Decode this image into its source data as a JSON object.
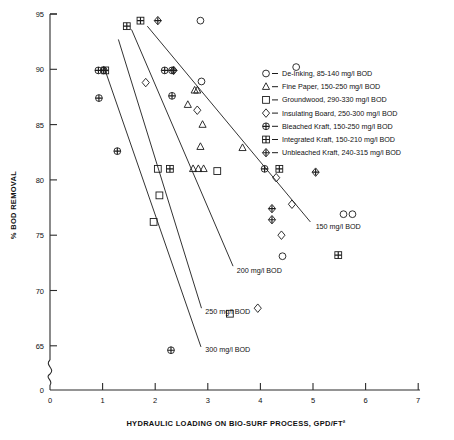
{
  "chart_data": {
    "type": "scatter",
    "title": "",
    "xlabel": "HYDRAULIC LOADING ON BIO-SURF PROCESS, GPD/FT²",
    "ylabel": "% BOD REMOVAL",
    "xlim": [
      0,
      7
    ],
    "ylim_break": true,
    "ylim": [
      63,
      95
    ],
    "y_break_value": "0",
    "grid": false,
    "legend_position": "upper-right",
    "xticks": [
      "0",
      "1",
      "2",
      "3",
      "4",
      "5",
      "6",
      "7"
    ],
    "yticks": [
      "0",
      "65",
      "70",
      "75",
      "80",
      "85",
      "90",
      "95"
    ],
    "legend": [
      {
        "symbol": "circle-open",
        "label": "De-Inking, 85-140 mg/l BOD"
      },
      {
        "symbol": "triangle-open",
        "label": "Fine Paper, 150-250 mg/l BOD"
      },
      {
        "symbol": "square-open",
        "label": "Groundwood, 290-330 mg/l BOD"
      },
      {
        "symbol": "diamond-open",
        "label": "Insulating Board, 250-300 mg/l BOD"
      },
      {
        "symbol": "circle-cross",
        "label": "Bleached Kraft, 150-250 mg/l BOD"
      },
      {
        "symbol": "square-cross",
        "label": "Integrated Kraft, 150-210 mg/l BOD"
      },
      {
        "symbol": "diamond-cross",
        "label": "Unbleached Kraft, 240-315 mg/l BOD"
      }
    ],
    "annotations": [
      {
        "text": "150 mg/l BOD",
        "x": 5.05,
        "y": 75.6
      },
      {
        "text": "200 mg/l BOD",
        "x": 3.55,
        "y": 71.6
      },
      {
        "text": "250 mg/l BOD",
        "x": 2.95,
        "y": 67.9
      },
      {
        "text": "300 mg/l BOD",
        "x": 2.95,
        "y": 64.4
      }
    ],
    "trend_lines": [
      {
        "name": "150 mg/l BOD",
        "x1": 1.85,
        "y1": 93.9,
        "x2": 4.95,
        "y2": 76.2
      },
      {
        "name": "200 mg/l BOD",
        "x1": 1.55,
        "y1": 93.6,
        "x2": 3.48,
        "y2": 72.2
      },
      {
        "name": "250 mg/l BOD",
        "x1": 1.3,
        "y1": 92.7,
        "x2": 2.88,
        "y2": 68.4
      },
      {
        "name": "300 mg/l BOD",
        "x1": 1.02,
        "y1": 90.3,
        "x2": 2.87,
        "y2": 64.9
      }
    ],
    "series": [
      {
        "name": "De-Inking, 85-140 mg/l BOD",
        "symbol": "circle-open",
        "points": [
          [
            2.86,
            94.4
          ],
          [
            4.68,
            90.2
          ],
          [
            2.88,
            88.9
          ],
          [
            5.58,
            76.9
          ],
          [
            5.75,
            76.9
          ],
          [
            4.42,
            73.1
          ]
        ]
      },
      {
        "name": "Fine Paper, 150-250 mg/l BOD",
        "symbol": "triangle-open",
        "points": [
          [
            2.75,
            88.1
          ],
          [
            2.8,
            88.1
          ],
          [
            2.62,
            86.8
          ],
          [
            2.9,
            85.0
          ],
          [
            2.86,
            83.0
          ],
          [
            2.72,
            81.0
          ],
          [
            2.82,
            81.0
          ],
          [
            2.92,
            81.0
          ],
          [
            3.66,
            82.9
          ]
        ]
      },
      {
        "name": "Groundwood, 290-330 mg/l BOD",
        "symbol": "square-open",
        "points": [
          [
            2.05,
            81.0
          ],
          [
            2.08,
            78.6
          ],
          [
            1.97,
            76.2
          ],
          [
            3.18,
            80.8
          ],
          [
            3.42,
            67.9
          ]
        ]
      },
      {
        "name": "Insulating Board, 250-300 mg/l BOD",
        "symbol": "diamond-open",
        "points": [
          [
            1.82,
            88.8
          ],
          [
            2.8,
            86.3
          ],
          [
            4.3,
            80.2
          ],
          [
            4.6,
            77.8
          ],
          [
            4.4,
            75.0
          ],
          [
            3.95,
            68.4
          ]
        ]
      },
      {
        "name": "Bleached Kraft, 150-250 mg/l BOD",
        "symbol": "circle-cross",
        "points": [
          [
            0.92,
            89.9
          ],
          [
            1.02,
            89.9
          ],
          [
            2.18,
            89.9
          ],
          [
            2.32,
            89.9
          ],
          [
            0.93,
            87.4
          ],
          [
            1.28,
            82.6
          ],
          [
            2.32,
            87.6
          ],
          [
            4.08,
            81.0
          ],
          [
            2.3,
            64.6
          ]
        ]
      },
      {
        "name": "Integrated Kraft, 150-210 mg/l BOD",
        "symbol": "square-cross",
        "points": [
          [
            1.05,
            89.9
          ],
          [
            1.46,
            93.9
          ],
          [
            1.72,
            94.4
          ],
          [
            2.28,
            81.0
          ],
          [
            4.36,
            81.0
          ],
          [
            5.48,
            73.2
          ]
        ]
      },
      {
        "name": "Unbleached Kraft, 240-315 mg/l BOD",
        "symbol": "diamond-cross",
        "points": [
          [
            2.05,
            94.4
          ],
          [
            2.35,
            89.9
          ],
          [
            4.22,
            77.4
          ],
          [
            4.22,
            76.4
          ],
          [
            5.05,
            80.7
          ]
        ]
      }
    ]
  }
}
